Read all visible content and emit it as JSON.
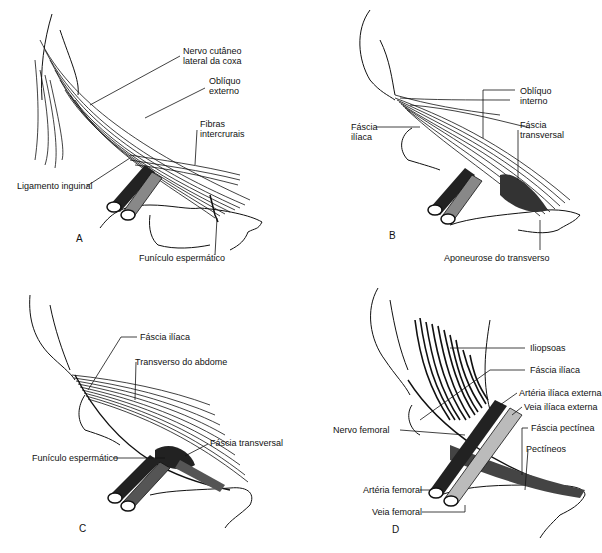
{
  "figure": {
    "panels": [
      {
        "id": "A",
        "letter": "A",
        "labels": [
          {
            "text": "Nervo cutâneo",
            "text2": "lateral da coxa"
          },
          {
            "text": "Oblíquo",
            "text2": "externo"
          },
          {
            "text": "Fibras",
            "text2": "intercrurais"
          },
          {
            "text": "Ligamento inguinal"
          },
          {
            "text": "Funículo espermático"
          }
        ]
      },
      {
        "id": "B",
        "letter": "B",
        "labels": [
          {
            "text": "Oblíquo",
            "text2": "interno"
          },
          {
            "text": "Fáscia",
            "text2": "ilíaca"
          },
          {
            "text": "Fáscia",
            "text2": "transversal"
          },
          {
            "text": "Aponeurose do transverso"
          }
        ]
      },
      {
        "id": "C",
        "letter": "C",
        "labels": [
          {
            "text": "Fáscia ilíaca"
          },
          {
            "text": "Transverso do abdome"
          },
          {
            "text": "Fáscia transversal"
          },
          {
            "text": "Funículo espermático"
          }
        ]
      },
      {
        "id": "D",
        "letter": "D",
        "labels": [
          {
            "text": "Iliopsoas"
          },
          {
            "text": "Fáscia ilíaca"
          },
          {
            "text": "Artéria ilíaca externa"
          },
          {
            "text": "Veia ilíaca externa"
          },
          {
            "text": "Nervo femoral"
          },
          {
            "text": "Fáscia pectínea"
          },
          {
            "text": "Pectíneos"
          },
          {
            "text": "Artéria femoral"
          },
          {
            "text": "Veia femoral"
          }
        ]
      }
    ]
  }
}
